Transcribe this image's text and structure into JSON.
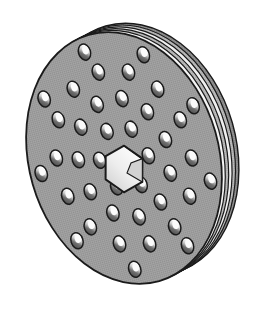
{
  "figure": {
    "title": "Perforated Disc",
    "view": "isometric-three-quarter",
    "canvas": {
      "width": 261,
      "height": 311,
      "background": "#ffffff"
    }
  },
  "colors": {
    "background": "#ffffff",
    "face_fill": "#9a9a9a",
    "face_fill_light": "#a6a6a6",
    "outline": "#1a1a1a",
    "rim_band_dark": "#8d8d8d",
    "rim_band_mid": "#b4b4b4",
    "rim_band_light": "#f2f2f2",
    "hole_shadow": "#4f4f4f",
    "hole_highlight": "#fbfbfb",
    "center_hole_fill": "#f4f4f4",
    "center_hole_facet": "#d2d2d2"
  },
  "geometry": {
    "face_center": {
      "x": 124,
      "y": 158
    },
    "face_radius_x": 95,
    "face_radius_y": 128,
    "face_rotation_deg": -16,
    "rim_offset": {
      "x": 17,
      "y": -9
    },
    "rim_band_count": 5,
    "hole_size": {
      "rx": 6.0,
      "ry": 8.2
    },
    "hole_rotation_deg": -18
  },
  "center_hole": {
    "name": "hexagonal-bore",
    "center": {
      "x": 124,
      "y": 169
    },
    "radius": 21,
    "sides": 6,
    "rotation_deg": -12
  },
  "rings": [
    {
      "name": "inner-ring",
      "radius_scale": 0.255,
      "count": 6,
      "phase_deg": 8
    },
    {
      "name": "middle-ring",
      "radius_scale": 0.475,
      "count": 11,
      "phase_deg": -6
    },
    {
      "name": "outer-ring",
      "radius_scale": 0.7,
      "count": 14,
      "phase_deg": 12
    },
    {
      "name": "rim-ring",
      "radius_scale": 0.885,
      "count": 9,
      "phase_deg": 24
    }
  ],
  "labels": {
    "figure_label": "Perforated Disc",
    "face_label": "disc-face",
    "rim_label": "layered-rim-stack",
    "bore_label": "central-hexagonal-bore",
    "holes_label": "perforation-holes"
  }
}
